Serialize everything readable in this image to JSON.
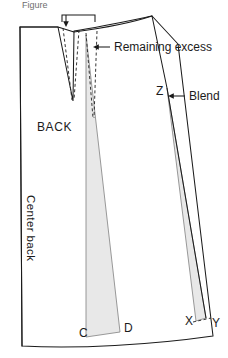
{
  "figure": {
    "caption_partial": "Figure",
    "background_color": "#ffffff",
    "line_color": "#1b1b1b",
    "wedge_fill_color": "#e8e8e8",
    "wedge_stroke_color": "#8d8d8d",
    "dashed_line_color": "#2a2a2a"
  },
  "labels": {
    "piece_name": "BACK",
    "center_back": "Center back",
    "remaining_excess": "Remaining excess",
    "blend": "Blend"
  },
  "points": {
    "c": "C",
    "d": "D",
    "x": "X",
    "y": "Y",
    "z": "Z"
  },
  "icons": {
    "left_arrow": "arrow-left-icon",
    "down_arrow": "arrow-down-icon",
    "bracket": "measure-bracket-icon"
  },
  "diagram": {
    "type": "sewing-pattern-draft",
    "shaded_wedges": 2,
    "dart_count": 1
  }
}
